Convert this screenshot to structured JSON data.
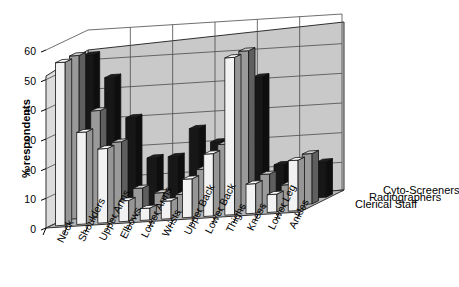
{
  "chart_data": {
    "type": "bar",
    "title": "",
    "subtitle": "",
    "xlabel": "",
    "ylabel": "% respondents",
    "ylim": [
      0,
      60
    ],
    "yticks": [
      0,
      10,
      20,
      30,
      40,
      50,
      60
    ],
    "grid": true,
    "projection": "3d",
    "legend_position": "right",
    "categories": [
      "Neck",
      "Shoulders",
      "Upper Arms",
      "Elbows",
      "Lower Arms",
      "Wrists",
      "Upper Back",
      "Lower Back",
      "Thighs",
      "Knees",
      "Lower Leg",
      "Ankles"
    ],
    "series": [
      {
        "name": "Clerical Staff",
        "color": "#f2f2f2",
        "values": [
          55,
          31,
          25,
          7,
          4,
          6,
          13,
          21,
          53,
          10,
          6,
          17
        ]
      },
      {
        "name": "Radiographers",
        "color": "#9a9a9a",
        "values": [
          55,
          36,
          25,
          9,
          7,
          6,
          14,
          22,
          53,
          11,
          7,
          17
        ]
      },
      {
        "name": "Cyto-Screeners",
        "color": "#171717",
        "values": [
          53,
          45,
          31,
          17,
          17,
          26,
          21,
          28,
          42,
          12,
          11,
          12
        ]
      }
    ],
    "colors": {
      "wall": "#c9c9c9",
      "floor": "#b4b4b4",
      "grid": "#4a4a4a",
      "axis": "#000000"
    }
  }
}
